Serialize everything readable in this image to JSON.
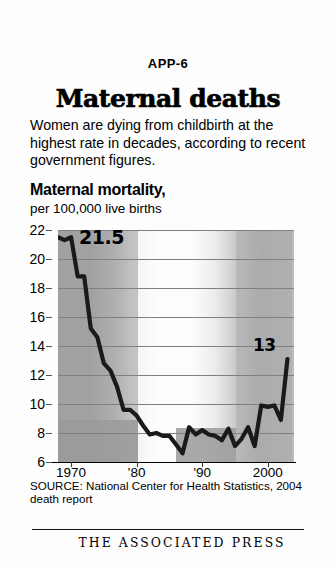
{
  "header": {
    "slug": "APP-6",
    "headline": "Maternal deaths",
    "deck": "Women are dying from childbirth at the highest rate in decades, according to recent government figures."
  },
  "chart_header": {
    "title": "Maternal mortality,",
    "subtitle": "per 100,000 live births"
  },
  "footer": {
    "source": "SOURCE: National Center for Health Statistics, 2004 death report",
    "credit": "THE ASSOCIATED PRESS"
  },
  "colors": {
    "ink": "#000000",
    "line": "#1a1a1a",
    "grid": "#808080",
    "band": "#9a9a9a",
    "plot_light": "#fdfdfd",
    "plot_dark": "#a9a9a9"
  },
  "chart_data": {
    "type": "line",
    "title": "Maternal mortality,",
    "subtitle": "per 100,000 live births",
    "xlabel": "",
    "ylabel": "deaths per 100,000 live births",
    "xlim": [
      1968,
      2004
    ],
    "ylim": [
      6,
      22
    ],
    "grid": true,
    "legend": null,
    "ytick_labels": [
      "6",
      "8",
      "10",
      "12",
      "14",
      "16",
      "18",
      "20",
      "22"
    ],
    "yticks": [
      6,
      8,
      10,
      12,
      14,
      16,
      18,
      20,
      22
    ],
    "xtick_labels": [
      "1970",
      "'80",
      "'90",
      "2000"
    ],
    "xticks": [
      1970,
      1980,
      1990,
      2000
    ],
    "annotations": [
      {
        "text": "21.5",
        "x": 1970,
        "y": 21.5
      },
      {
        "text": "13",
        "x": 2002,
        "y": 13.1
      }
    ],
    "x": [
      1968,
      1969,
      1970,
      1971,
      1972,
      1973,
      1974,
      1975,
      1976,
      1977,
      1978,
      1979,
      1980,
      1981,
      1982,
      1983,
      1984,
      1985,
      1986,
      1987,
      1988,
      1989,
      1990,
      1991,
      1992,
      1993,
      1994,
      1995,
      1996,
      1997,
      1998,
      1999,
      2000,
      2001,
      2002,
      2003
    ],
    "values": [
      21.5,
      21.3,
      21.5,
      18.8,
      18.8,
      15.2,
      14.6,
      12.8,
      12.3,
      11.2,
      9.6,
      9.6,
      9.2,
      8.5,
      7.9,
      8.0,
      7.8,
      7.8,
      7.2,
      6.6,
      8.4,
      7.9,
      8.2,
      7.9,
      7.8,
      7.5,
      8.3,
      7.1,
      7.6,
      8.4,
      7.1,
      9.9,
      9.8,
      9.9,
      8.9,
      13.1
    ]
  }
}
